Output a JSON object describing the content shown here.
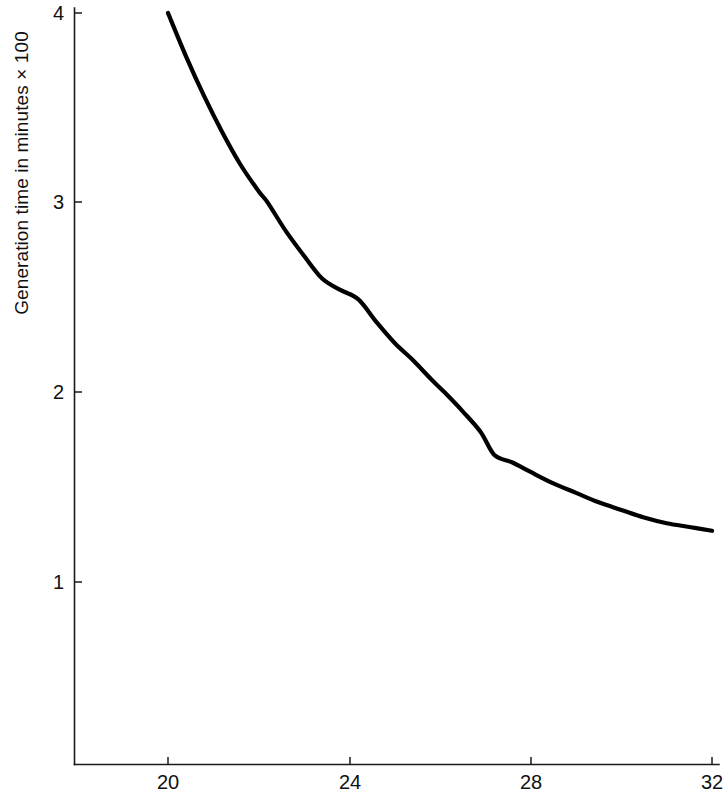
{
  "chart_data": {
    "type": "line",
    "title": "",
    "subtitle": "",
    "xlabel": "",
    "ylabel": "Generation time in minutes × 100",
    "xlim": [
      19.0,
      32.0
    ],
    "ylim": [
      0.0,
      4.05
    ],
    "grid": false,
    "legend": null,
    "x_ticks": [
      "20",
      "24",
      "28",
      "32"
    ],
    "x_tick_values": [
      20,
      24,
      28,
      32
    ],
    "y_ticks": [
      "1",
      "2",
      "3",
      "4"
    ],
    "y_tick_values": [
      1,
      2,
      3,
      4
    ],
    "series": [
      {
        "name": "Generation time",
        "color": "#000000",
        "x": [
          20.0,
          20.4,
          20.8,
          21.2,
          21.6,
          22.0,
          22.2,
          22.6,
          23.0,
          23.4,
          23.8,
          24.2,
          24.6,
          25.0,
          25.4,
          25.8,
          26.1,
          26.5,
          26.9,
          27.2,
          27.6,
          28.0,
          28.5,
          29.0,
          29.5,
          30.0,
          30.5,
          31.0,
          31.5,
          32.0
        ],
        "y": [
          4.0,
          3.77,
          3.56,
          3.37,
          3.2,
          3.06,
          3.0,
          2.85,
          2.72,
          2.6,
          2.54,
          2.49,
          2.37,
          2.26,
          2.17,
          2.07,
          2.0,
          1.9,
          1.79,
          1.67,
          1.63,
          1.58,
          1.52,
          1.47,
          1.42,
          1.38,
          1.34,
          1.31,
          1.29,
          1.27
        ]
      }
    ],
    "annotations": []
  },
  "axes": {
    "y_title": "Generation time in minutes × 100",
    "y_tick_labels": [
      "4",
      "3",
      "2",
      "1"
    ],
    "x_tick_labels": [
      "20",
      "24",
      "28",
      "32"
    ]
  },
  "colors": {
    "curve": "#000000",
    "axis": "#1a1a1a",
    "background": "#ffffff",
    "text": "#111111"
  }
}
